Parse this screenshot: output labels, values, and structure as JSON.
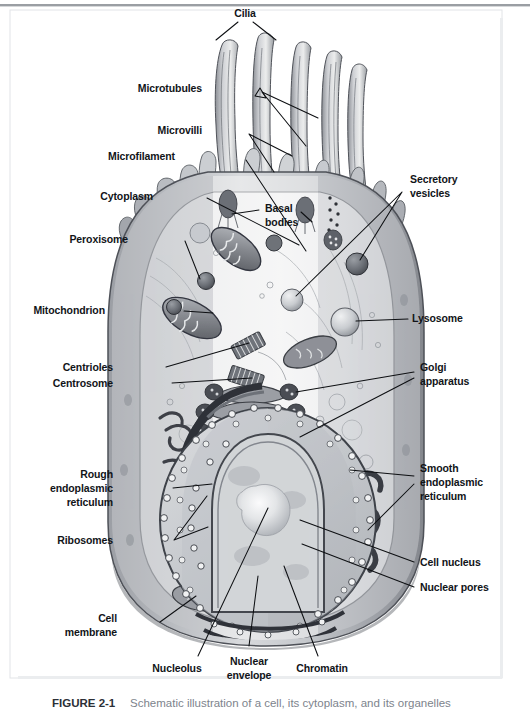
{
  "figure": {
    "title": "Schematic illustration of a cell, its cytoplasm, and its organelles",
    "caption_number": "FIGURE 2-1",
    "caption_text": "Schematic illustration of a cell, its cytoplasm, and its organelles",
    "frame_color": "#d8dade",
    "background_color": "#ffffff"
  },
  "diagram": {
    "type": "labeled-anatomical-illustration",
    "style": "grayscale textbook line-and-wash illustration",
    "palette": {
      "membrane_outer": "#8f9298",
      "membrane_inner": "#b9bcc1",
      "cytoplasm": "#e9eaec",
      "cytoplasm_light": "#f3f4f5",
      "organelle_dark": "#4a4d53",
      "organelle_mid": "#898d94",
      "organelle_light": "#cfd2d6",
      "nucleus": "#cdd0d4",
      "nucleolus": "#f2f3f4",
      "outline": "#3a3d42",
      "leader_line": "#0d0f12",
      "label_text": "#111418"
    }
  },
  "labels_left": [
    {
      "id": "microtubules",
      "text": "Microtubules",
      "x": 202,
      "y": 89
    },
    {
      "id": "microvilli",
      "text": "Microvilli",
      "x": 202,
      "y": 131
    },
    {
      "id": "microfilament",
      "text": "Microfilament",
      "x": 175,
      "y": 157
    },
    {
      "id": "cytoplasm",
      "text": "Cytoplasm",
      "x": 153,
      "y": 196
    },
    {
      "id": "peroxisome",
      "text": "Peroxisome",
      "x": 128,
      "y": 240
    },
    {
      "id": "mitochondrion",
      "text": "Mitochondrion",
      "x": 105,
      "y": 310
    },
    {
      "id": "centrioles",
      "text": "Centrioles",
      "x": 113,
      "y": 368
    },
    {
      "id": "centrosome",
      "text": "Centrosome",
      "x": 113,
      "y": 383
    },
    {
      "id": "ribosomes",
      "text": "Ribosomes",
      "x": 113,
      "y": 540
    }
  ],
  "labels_left_multiline": [
    {
      "id": "rough-endoplasmic-reticulum",
      "lines": [
        "Rough",
        "endoplasmic",
        "reticulum"
      ],
      "x": 113,
      "y": 489
    },
    {
      "id": "cell-membrane",
      "lines": [
        "Cell",
        "membrane"
      ],
      "x": 117,
      "y": 629
    }
  ],
  "labels_right": [
    {
      "id": "lysosome",
      "text": "Lysosome",
      "x": 412,
      "y": 318
    },
    {
      "id": "cell-nucleus",
      "text": "Cell nucleus",
      "x": 420,
      "y": 562
    },
    {
      "id": "nuclear-pores",
      "text": "Nuclear pores",
      "x": 420,
      "y": 587
    }
  ],
  "labels_right_multiline": [
    {
      "id": "secretory-vesicles",
      "lines": [
        "Secretory",
        "vesicles"
      ],
      "x": 410,
      "y": 188
    },
    {
      "id": "golgi-apparatus",
      "lines": [
        "Golgi",
        "apparatus"
      ],
      "x": 420,
      "y": 375
    },
    {
      "id": "smooth-endoplasmic-reticulum",
      "lines": [
        "Smooth",
        "endoplasmic",
        "reticulum"
      ],
      "x": 420,
      "y": 483
    }
  ],
  "labels_center": [
    {
      "id": "cilia",
      "text": "Cilia",
      "x": 245,
      "y": 14
    }
  ],
  "labels_center_multiline": [
    {
      "id": "basal-bodies",
      "lines": [
        "Basal",
        "bodies"
      ],
      "x": 265,
      "y": 216
    },
    {
      "id": "nucleolus",
      "lines": [
        "Nucleolus"
      ],
      "x": 177,
      "y": 670
    },
    {
      "id": "nuclear-envelope",
      "lines": [
        "Nuclear",
        "envelope"
      ],
      "x": 249,
      "y": 662
    },
    {
      "id": "chromatin",
      "lines": [
        "Chromatin"
      ],
      "x": 322,
      "y": 670
    }
  ],
  "organelles": [
    "cilia",
    "microvilli",
    "microtubules",
    "microfilament",
    "basal bodies",
    "cytoplasm",
    "peroxisome",
    "mitochondrion",
    "centrioles",
    "centrosome",
    "rough endoplasmic reticulum",
    "ribosomes",
    "cell membrane",
    "secretory vesicles",
    "lysosome",
    "golgi apparatus",
    "smooth endoplasmic reticulum",
    "cell nucleus",
    "nuclear pores",
    "nucleolus",
    "nuclear envelope",
    "chromatin"
  ]
}
